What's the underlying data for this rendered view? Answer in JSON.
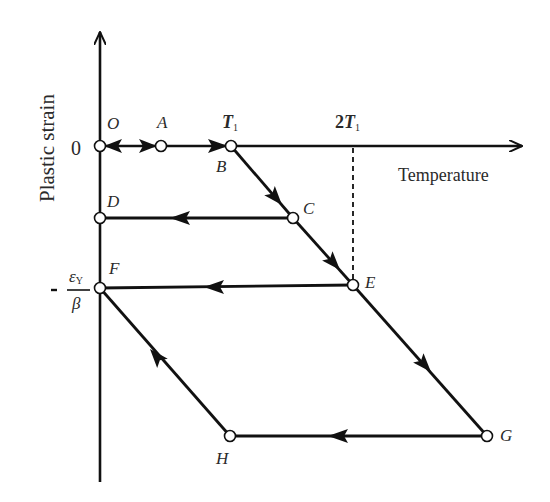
{
  "diagram": {
    "y_axis_label": "Plastic strain",
    "x_axis_label": "Temperature",
    "y_zero_label": "0",
    "x_ticks": [
      {
        "main": "T",
        "sub": "1"
      },
      {
        "prefix": "2",
        "main": "T",
        "sub": "1"
      }
    ],
    "y_tick_fraction": {
      "sign": "-",
      "numerator": "ε",
      "numerator_sub": "Y",
      "denominator": "β"
    },
    "points": [
      {
        "label": "O",
        "x": 100,
        "y": 146
      },
      {
        "label": "A",
        "x": 161,
        "y": 146
      },
      {
        "label": "B",
        "x": 231,
        "y": 146
      },
      {
        "label": "C",
        "x": 293,
        "y": 218
      },
      {
        "label": "D",
        "x": 100,
        "y": 218
      },
      {
        "label": "E",
        "x": 353,
        "y": 285
      },
      {
        "label": "F",
        "x": 100,
        "y": 288
      },
      {
        "label": "G",
        "x": 487,
        "y": 436
      },
      {
        "label": "H",
        "x": 230,
        "y": 436
      }
    ],
    "paths": [
      {
        "from": "O",
        "to": "A",
        "direction": "both"
      },
      {
        "from": "A",
        "to": "B",
        "direction": "forward"
      },
      {
        "from": "B",
        "to": "C",
        "direction": "forward"
      },
      {
        "from": "C",
        "to": "D",
        "direction": "forward"
      },
      {
        "from": "C",
        "to": "E",
        "direction": "forward"
      },
      {
        "from": "E",
        "to": "F",
        "direction": "forward"
      },
      {
        "from": "E",
        "to": "G",
        "direction": "forward"
      },
      {
        "from": "G",
        "to": "H",
        "direction": "forward"
      },
      {
        "from": "H",
        "to": "F",
        "direction": "forward"
      }
    ],
    "dashed_guide": {
      "from": "2T1 on x-axis",
      "to": "E"
    },
    "line_color": "#111111",
    "text_color": "#2a2a2a"
  }
}
